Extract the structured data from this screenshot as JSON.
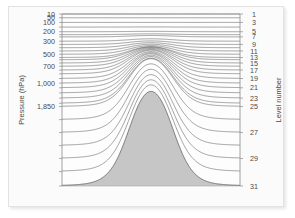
{
  "figure": {
    "background_color": "#fbfbfb",
    "border_color": "#e2e2e2"
  },
  "chart_data": {
    "type": "line",
    "title": "",
    "subtitle": "",
    "xlabel": "",
    "ylabel": "Pressure (hPa)",
    "y2label": "Level number",
    "grid": false,
    "legend": null,
    "line_color": "#555555",
    "terrain_fill": "#c6c6c6",
    "terrain_edge": "#9a9a9a",
    "plot_background": "#fdfdfd",
    "yaxis": {
      "scale": "pressure-levels",
      "ylim_top": 10,
      "ylim_bottom": 1850,
      "tick_labels": [
        "10",
        "50",
        "100",
        "200",
        "300",
        "500",
        "700",
        "1,000",
        "1,850"
      ],
      "tick_values": [
        10,
        50,
        100,
        200,
        300,
        500,
        700,
        1000,
        1850
      ],
      "tick_level_index": [
        1,
        2,
        3,
        5,
        8,
        12,
        16,
        20,
        25
      ],
      "minor_tick_count": 31,
      "unit": "hPa"
    },
    "yaxis_right": {
      "label": "Level number",
      "tick_labels": [
        "1",
        "3",
        "5",
        "7",
        "9",
        "11",
        "13",
        "15",
        "17",
        "19",
        "21",
        "23",
        "25",
        "27",
        "29",
        "31"
      ],
      "tick_values": [
        1,
        3,
        5,
        7,
        9,
        11,
        13,
        15,
        17,
        19,
        21,
        23,
        25,
        27,
        29,
        31
      ],
      "level_count": 31
    },
    "xaxis": {
      "tick_labels": [],
      "label": "",
      "xlim": [
        0,
        1
      ]
    },
    "levels": [
      {
        "number": 1,
        "pressure": 10,
        "sigma": 0.0,
        "terrain_following": 0.0
      },
      {
        "number": 2,
        "pressure": 50,
        "sigma": 0.022,
        "terrain_following": 0.0
      },
      {
        "number": 3,
        "pressure": 100,
        "sigma": 0.049,
        "terrain_following": 0.0
      },
      {
        "number": 4,
        "pressure": 150,
        "sigma": 0.076,
        "terrain_following": 0.02
      },
      {
        "number": 5,
        "pressure": 200,
        "sigma": 0.103,
        "terrain_following": 0.04
      },
      {
        "number": 6,
        "pressure": 230,
        "sigma": 0.12,
        "terrain_following": 0.07
      },
      {
        "number": 7,
        "pressure": 255,
        "sigma": 0.133,
        "terrain_following": 0.11
      },
      {
        "number": 8,
        "pressure": 300,
        "sigma": 0.158,
        "terrain_following": 0.16
      },
      {
        "number": 9,
        "pressure": 335,
        "sigma": 0.177,
        "terrain_following": 0.21
      },
      {
        "number": 10,
        "pressure": 370,
        "sigma": 0.196,
        "terrain_following": 0.27
      },
      {
        "number": 11,
        "pressure": 405,
        "sigma": 0.215,
        "terrain_following": 0.33
      },
      {
        "number": 12,
        "pressure": 440,
        "sigma": 0.234,
        "terrain_following": 0.39
      },
      {
        "number": 13,
        "pressure": 475,
        "sigma": 0.253,
        "terrain_following": 0.45
      },
      {
        "number": 14,
        "pressure": 500,
        "sigma": 0.266,
        "terrain_following": 0.51
      },
      {
        "number": 15,
        "pressure": 535,
        "sigma": 0.285,
        "terrain_following": 0.57
      },
      {
        "number": 16,
        "pressure": 570,
        "sigma": 0.304,
        "terrain_following": 0.62
      },
      {
        "number": 17,
        "pressure": 610,
        "sigma": 0.326,
        "terrain_following": 0.67
      },
      {
        "number": 18,
        "pressure": 650,
        "sigma": 0.348,
        "terrain_following": 0.72
      },
      {
        "number": 19,
        "pressure": 700,
        "sigma": 0.375,
        "terrain_following": 0.76
      },
      {
        "number": 20,
        "pressure": 750,
        "sigma": 0.402,
        "terrain_following": 0.8
      },
      {
        "number": 21,
        "pressure": 800,
        "sigma": 0.429,
        "terrain_following": 0.84
      },
      {
        "number": 22,
        "pressure": 855,
        "sigma": 0.459,
        "terrain_following": 0.87
      },
      {
        "number": 23,
        "pressure": 910,
        "sigma": 0.489,
        "terrain_following": 0.9
      },
      {
        "number": 24,
        "pressure": 965,
        "sigma": 0.519,
        "terrain_following": 0.92
      },
      {
        "number": 25,
        "pressure": 1000,
        "sigma": 0.538,
        "terrain_following": 0.94
      },
      {
        "number": 26,
        "pressure": 1140,
        "sigma": 0.614,
        "terrain_following": 0.96
      },
      {
        "number": 27,
        "pressure": 1280,
        "sigma": 0.689,
        "terrain_following": 0.97
      },
      {
        "number": 28,
        "pressure": 1420,
        "sigma": 0.765,
        "terrain_following": 0.98
      },
      {
        "number": 29,
        "pressure": 1560,
        "sigma": 0.84,
        "terrain_following": 0.99
      },
      {
        "number": 30,
        "pressure": 1700,
        "sigma": 0.916,
        "terrain_following": 1.0
      },
      {
        "number": 31,
        "pressure": 1850,
        "sigma": 1.0,
        "terrain_following": 1.0
      }
    ],
    "terrain": {
      "shape": "bell",
      "peak_x_fraction": 0.5,
      "peak_height_fraction": 0.55,
      "half_width_fraction": 0.155,
      "base_level": 31,
      "peak_pressure": 500
    }
  }
}
